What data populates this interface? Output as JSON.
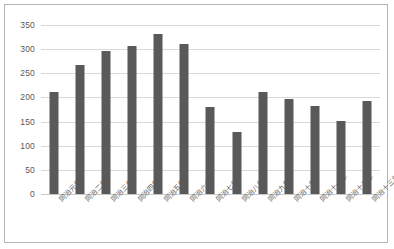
{
  "chart_data": {
    "type": "bar",
    "title": "",
    "xlabel": "",
    "ylabel": "",
    "grid": true,
    "legend": "none",
    "ylim": [
      0,
      350
    ],
    "ytick_step": 50,
    "ytick_labels": [
      "0",
      "50",
      "100",
      "150",
      "200",
      "250",
      "300",
      "350"
    ],
    "ytick_values": [
      0,
      50,
      100,
      150,
      200,
      250,
      300,
      350
    ],
    "categories": [
      "同治元年",
      "同治二年",
      "同治三年",
      "同治四年",
      "同治五年",
      "同治六年",
      "同治七年",
      "同治八年",
      "同治九年",
      "同治十年",
      "同治十一年",
      "同治十二年",
      "同治十三年"
    ],
    "values": [
      212,
      267,
      296,
      306,
      331,
      311,
      181,
      129,
      211,
      196,
      182,
      152,
      193
    ],
    "bar_color": "#595959",
    "gridline_color": "#d9d9d9",
    "border_color": "#b5b5b5",
    "axis_text_color": "#5a5a5a"
  }
}
